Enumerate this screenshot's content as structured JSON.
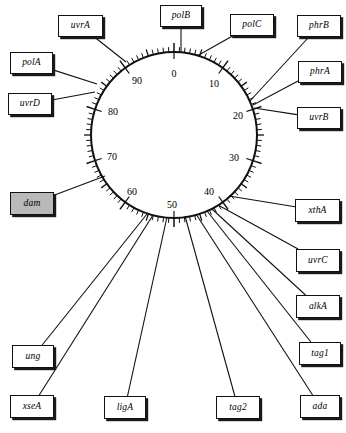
{
  "figure": {
    "type": "circular-genetic-map",
    "organism_map_units": "minutes",
    "circle": {
      "cx": 174,
      "cy": 135,
      "r": 83
    },
    "highlight_color": "#b9b9b9",
    "line_color": "#111111",
    "background_color": "#ffffff"
  },
  "scale": {
    "ticks_total": 100,
    "minor_tick_interval": 1,
    "major_tick_interval": 5,
    "labeled_tick_interval": 10,
    "labels": [
      {
        "text": "0",
        "value": 0,
        "x": 174,
        "y": 73
      },
      {
        "text": "10",
        "value": 10,
        "x": 214,
        "y": 83
      },
      {
        "text": "20",
        "value": 20,
        "x": 238,
        "y": 115
      },
      {
        "text": "30",
        "value": 30,
        "x": 234,
        "y": 157
      },
      {
        "text": "40",
        "value": 40,
        "x": 209,
        "y": 191
      },
      {
        "text": "50",
        "value": 50,
        "x": 172,
        "y": 204
      },
      {
        "text": "60",
        "value": 60,
        "x": 132,
        "y": 191
      },
      {
        "text": "70",
        "value": 70,
        "x": 112,
        "y": 156
      },
      {
        "text": "80",
        "value": 80,
        "x": 113,
        "y": 111
      },
      {
        "text": "90",
        "value": 90,
        "x": 137,
        "y": 80
      }
    ]
  },
  "genes": [
    {
      "name": "uvrA",
      "box": {
        "x": 58,
        "y": 15,
        "w": 45,
        "h": 22
      },
      "map_position": 92,
      "anchor": {
        "x": 126,
        "y": 62
      }
    },
    {
      "name": "polB",
      "box": {
        "x": 160,
        "y": 5,
        "w": 42,
        "h": 22
      },
      "map_position": 0,
      "anchor": {
        "x": 181,
        "y": 52
      }
    },
    {
      "name": "polC",
      "box": {
        "x": 230,
        "y": 14,
        "w": 44,
        "h": 22
      },
      "map_position": 4,
      "anchor": {
        "x": 197,
        "y": 56
      }
    },
    {
      "name": "phrB",
      "box": {
        "x": 297,
        "y": 15,
        "w": 44,
        "h": 22
      },
      "map_position": 16,
      "anchor": {
        "x": 250,
        "y": 101
      }
    },
    {
      "name": "polA",
      "box": {
        "x": 10,
        "y": 52,
        "w": 43,
        "h": 22
      },
      "map_position": 86,
      "anchor": {
        "x": 97,
        "y": 84
      }
    },
    {
      "name": "phrA",
      "box": {
        "x": 298,
        "y": 61,
        "w": 44,
        "h": 22
      },
      "map_position": 17,
      "anchor": {
        "x": 253,
        "y": 105
      }
    },
    {
      "name": "uvrD",
      "box": {
        "x": 8,
        "y": 93,
        "w": 44,
        "h": 22
      },
      "map_position": 84,
      "anchor": {
        "x": 95,
        "y": 92
      }
    },
    {
      "name": "uvrB",
      "box": {
        "x": 297,
        "y": 107,
        "w": 44,
        "h": 22
      },
      "map_position": 18,
      "anchor": {
        "x": 254,
        "y": 108
      }
    },
    {
      "name": "dam",
      "box": {
        "x": 10,
        "y": 192,
        "w": 44,
        "h": 23
      },
      "map_position": 64,
      "anchor": {
        "x": 105,
        "y": 176
      },
      "highlighted": true
    },
    {
      "name": "xthA",
      "box": {
        "x": 295,
        "y": 199,
        "w": 45,
        "h": 23
      },
      "map_position": 42,
      "anchor": {
        "x": 229,
        "y": 196
      }
    },
    {
      "name": "uvrC",
      "box": {
        "x": 296,
        "y": 249,
        "w": 44,
        "h": 23
      },
      "map_position": 42,
      "anchor": {
        "x": 218,
        "y": 205
      }
    },
    {
      "name": "alkA",
      "box": {
        "x": 296,
        "y": 295,
        "w": 44,
        "h": 23
      },
      "map_position": 44,
      "anchor": {
        "x": 212,
        "y": 209
      }
    },
    {
      "name": "tag1",
      "box": {
        "x": 299,
        "y": 342,
        "w": 42,
        "h": 23
      },
      "map_position": 45,
      "anchor": {
        "x": 207,
        "y": 211
      }
    },
    {
      "name": "ung",
      "box": {
        "x": 12,
        "y": 345,
        "w": 42,
        "h": 23
      },
      "map_position": 58,
      "anchor": {
        "x": 147,
        "y": 214
      }
    },
    {
      "name": "xseA",
      "box": {
        "x": 10,
        "y": 395,
        "w": 44,
        "h": 23
      },
      "map_position": 57,
      "anchor": {
        "x": 153,
        "y": 215
      }
    },
    {
      "name": "ligA",
      "box": {
        "x": 104,
        "y": 396,
        "w": 42,
        "h": 23
      },
      "map_position": 52,
      "anchor": {
        "x": 167,
        "y": 217
      }
    },
    {
      "name": "tag2",
      "box": {
        "x": 216,
        "y": 396,
        "w": 44,
        "h": 23
      },
      "map_position": 48,
      "anchor": {
        "x": 185,
        "y": 216
      }
    },
    {
      "name": "ada",
      "box": {
        "x": 300,
        "y": 395,
        "w": 40,
        "h": 23
      },
      "map_position": 47,
      "anchor": {
        "x": 196,
        "y": 214
      }
    }
  ],
  "chart_data": {
    "type": "scatter",
    "title": "",
    "xlabel": "",
    "ylabel": "",
    "categories": [
      "polB",
      "polC",
      "phrB",
      "phrA",
      "uvrB",
      "xthA",
      "uvrC",
      "alkA",
      "tag1",
      "ada",
      "tag2",
      "ligA",
      "xseA",
      "ung",
      "dam",
      "uvrD",
      "polA",
      "uvrA"
    ],
    "values": [
      0,
      4,
      16,
      17,
      18,
      42,
      42,
      44,
      45,
      47,
      48,
      52,
      57,
      58,
      64,
      84,
      86,
      92
    ]
  }
}
